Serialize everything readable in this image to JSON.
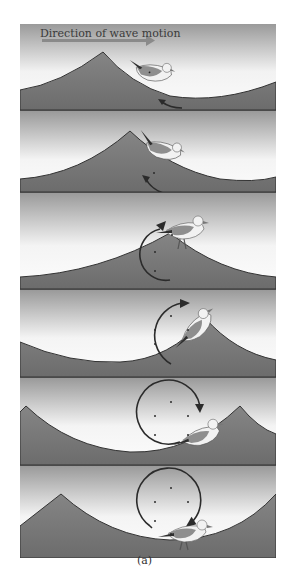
{
  "title": "Direction of wave motion",
  "caption": "(a)",
  "colors": {
    "sky_top": "#9a9a9a",
    "sky_bottom": "#f7f7f7",
    "water": "#7c7c7c",
    "water_dark": "#6a6a6a",
    "wave_line": "#333333",
    "gull_body": "#f2f2f2",
    "gull_wing": "#8e8e8e",
    "gull_wingtip": "#2e2e2e",
    "arrow": "#2b2b2b",
    "dot": "#2b2b2b",
    "title_arrow": "#8a8a8a"
  },
  "panels": [
    {
      "index": 1,
      "description": "Gull on trough behind crest; arrow pointing back-down"
    },
    {
      "index": 2,
      "description": "Gull on rising front of crest; arrow moving upward"
    },
    {
      "index": 3,
      "description": "Gull at crest; circular orbit arrow starting"
    },
    {
      "index": 4,
      "description": "Gull forward of crest; orbit arrow top half"
    },
    {
      "index": 5,
      "description": "Gull descending into trough; orbit mostly complete"
    },
    {
      "index": 6,
      "description": "Gull at trough bottom; orbit complete, arrow returning"
    }
  ]
}
